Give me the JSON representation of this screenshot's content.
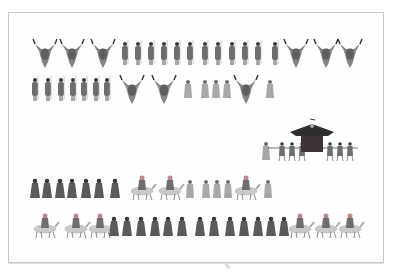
{
  "artwork": {
    "subject": "procession scroll illustration",
    "frame": {
      "x": 8,
      "y": 12,
      "width": 374,
      "height": 249,
      "border_color": "#c8c8c8",
      "background": "#fefefe"
    },
    "palette": {
      "ink_dark": "#3a3a3a",
      "ink_mid": "#6e6e6e",
      "ink_light": "#a8a8a8",
      "robe_gray": "#5a5a5a",
      "horse_light": "#c9c9c9",
      "horse_dark": "#6a6a6a",
      "palanquin": "#2e2e2e",
      "accent_red": "#8a3b30"
    },
    "rows": [
      {
        "name": "row-1-banners",
        "y": 52,
        "figures": [
          {
            "kind": "ox",
            "x": 45
          },
          {
            "kind": "ox",
            "x": 72
          },
          {
            "kind": "ox",
            "x": 103
          },
          {
            "kind": "standard",
            "x": 125
          },
          {
            "kind": "standard",
            "x": 138
          },
          {
            "kind": "standard",
            "x": 151
          },
          {
            "kind": "standard",
            "x": 164
          },
          {
            "kind": "standard",
            "x": 177
          },
          {
            "kind": "standard",
            "x": 190
          },
          {
            "kind": "standard",
            "x": 205
          },
          {
            "kind": "standard",
            "x": 218
          },
          {
            "kind": "standard",
            "x": 232
          },
          {
            "kind": "standard",
            "x": 245
          },
          {
            "kind": "standard",
            "x": 258
          },
          {
            "kind": "standard",
            "x": 275
          },
          {
            "kind": "ox",
            "x": 296
          },
          {
            "kind": "ox",
            "x": 326
          },
          {
            "kind": "ox",
            "x": 350
          }
        ]
      },
      {
        "name": "row-2-banners",
        "y": 88,
        "figures": [
          {
            "kind": "standard",
            "x": 35
          },
          {
            "kind": "standard",
            "x": 48
          },
          {
            "kind": "standard",
            "x": 61
          },
          {
            "kind": "standard",
            "x": 73
          },
          {
            "kind": "standard",
            "x": 84
          },
          {
            "kind": "standard",
            "x": 96
          },
          {
            "kind": "standard",
            "x": 107
          },
          {
            "kind": "ox",
            "x": 132
          },
          {
            "kind": "ox",
            "x": 164
          },
          {
            "kind": "attendant",
            "x": 188
          },
          {
            "kind": "attendant",
            "x": 205
          },
          {
            "kind": "attendant",
            "x": 216
          },
          {
            "kind": "attendant",
            "x": 227
          },
          {
            "kind": "ox",
            "x": 246
          },
          {
            "kind": "attendant",
            "x": 270
          }
        ]
      },
      {
        "name": "row-3-palanquin",
        "y": 150,
        "figures": [
          {
            "kind": "attendant",
            "x": 266
          },
          {
            "kind": "bearer",
            "x": 282
          },
          {
            "kind": "bearer",
            "x": 292
          },
          {
            "kind": "bearer",
            "x": 302
          },
          {
            "kind": "palanquin",
            "x": 312
          },
          {
            "kind": "bearer",
            "x": 330
          },
          {
            "kind": "bearer",
            "x": 340
          },
          {
            "kind": "bearer",
            "x": 350
          }
        ]
      },
      {
        "name": "row-4-officials",
        "y": 188,
        "figures": [
          {
            "kind": "official",
            "x": 35
          },
          {
            "kind": "official",
            "x": 47
          },
          {
            "kind": "official",
            "x": 60
          },
          {
            "kind": "official",
            "x": 72
          },
          {
            "kind": "official",
            "x": 86
          },
          {
            "kind": "official",
            "x": 99
          },
          {
            "kind": "official",
            "x": 115
          },
          {
            "kind": "rider",
            "x": 142
          },
          {
            "kind": "rider",
            "x": 170
          },
          {
            "kind": "attendant",
            "x": 190
          },
          {
            "kind": "attendant",
            "x": 206
          },
          {
            "kind": "attendant",
            "x": 217
          },
          {
            "kind": "attendant",
            "x": 228
          },
          {
            "kind": "rider",
            "x": 246
          },
          {
            "kind": "attendant",
            "x": 268
          }
        ]
      },
      {
        "name": "row-5-riders",
        "y": 226,
        "figures": [
          {
            "kind": "rider",
            "x": 45
          },
          {
            "kind": "rider",
            "x": 76
          },
          {
            "kind": "rider",
            "x": 100
          },
          {
            "kind": "official",
            "x": 114
          },
          {
            "kind": "official",
            "x": 127
          },
          {
            "kind": "official",
            "x": 141
          },
          {
            "kind": "official",
            "x": 155
          },
          {
            "kind": "official",
            "x": 168
          },
          {
            "kind": "official",
            "x": 182
          },
          {
            "kind": "official",
            "x": 200
          },
          {
            "kind": "official",
            "x": 214
          },
          {
            "kind": "official",
            "x": 230
          },
          {
            "kind": "official",
            "x": 244
          },
          {
            "kind": "official",
            "x": 258
          },
          {
            "kind": "official",
            "x": 271
          },
          {
            "kind": "official",
            "x": 284
          },
          {
            "kind": "rider",
            "x": 300
          },
          {
            "kind": "rider",
            "x": 326
          },
          {
            "kind": "rider",
            "x": 350
          }
        ]
      }
    ]
  }
}
